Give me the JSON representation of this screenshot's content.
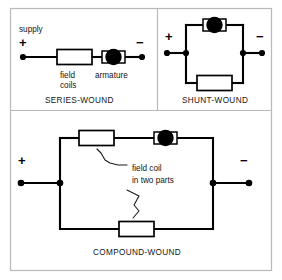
{
  "figure": {
    "background_color": "#ffffff",
    "line_color": "#000000",
    "frame_color": "#b9b9b9"
  },
  "panels": [
    {
      "id": "series-wound",
      "caption": "SERIES-WOUND",
      "supply_label": "supply",
      "positive_sign": "+",
      "negative_sign": "−",
      "components": [
        {
          "name": "field-coils",
          "label": "field\ncoils",
          "label_line1": "field",
          "label_line2": "coils",
          "type": "resistor"
        },
        {
          "name": "armature",
          "label": "armature",
          "type": "armature"
        }
      ],
      "topology": "series"
    },
    {
      "id": "shunt-wound",
      "caption": "SHUNT-WOUND",
      "positive_sign": "+",
      "negative_sign": "−",
      "components": [
        {
          "name": "armature",
          "label": "",
          "type": "armature",
          "branch": "top"
        },
        {
          "name": "field-coil",
          "label": "",
          "type": "resistor",
          "branch": "bottom"
        }
      ],
      "topology": "parallel"
    },
    {
      "id": "compound-wound",
      "caption": "COMPOUND-WOUND",
      "positive_sign": "+",
      "negative_sign": "−",
      "annotation_line1": "field coil",
      "annotation_line2": "in two parts",
      "components": [
        {
          "name": "field-coil-part-1",
          "label": "",
          "type": "resistor",
          "branch": "top"
        },
        {
          "name": "armature",
          "label": "",
          "type": "armature",
          "branch": "top"
        },
        {
          "name": "field-coil-part-2",
          "label": "",
          "type": "resistor",
          "branch": "bottom"
        }
      ],
      "topology": "parallel"
    }
  ]
}
